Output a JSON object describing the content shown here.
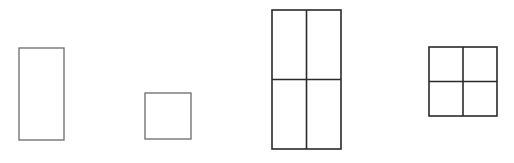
{
  "diagram": {
    "background": "#ffffff",
    "shapes": [
      {
        "id": "tall-rectangle",
        "type": "rectangle",
        "x": 19,
        "y": 48,
        "width": 45,
        "height": 92,
        "stroke": "#6a6a6a",
        "stroke_width": 1.3,
        "divisions": {
          "cols": 1,
          "rows": 1
        }
      },
      {
        "id": "small-square",
        "type": "square",
        "x": 145,
        "y": 93,
        "width": 46,
        "height": 46,
        "stroke": "#6a6a6a",
        "stroke_width": 1.3,
        "divisions": {
          "cols": 1,
          "rows": 1
        }
      },
      {
        "id": "tall-rectangle-divided",
        "type": "rectangle",
        "x": 272,
        "y": 10,
        "width": 69,
        "height": 139,
        "stroke": "#2a2a2a",
        "stroke_width": 1.6,
        "divisions": {
          "cols": 2,
          "rows": 2
        }
      },
      {
        "id": "square-divided",
        "type": "square",
        "x": 429,
        "y": 47,
        "width": 68,
        "height": 69,
        "stroke": "#2a2a2a",
        "stroke_width": 1.6,
        "divisions": {
          "cols": 2,
          "rows": 2
        }
      }
    ]
  }
}
